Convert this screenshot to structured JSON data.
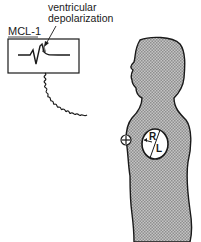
{
  "diagram": {
    "annotation": {
      "line1": "ventricular",
      "line2": "depolarization"
    },
    "monitor": {
      "lead_label": "MCL-1",
      "waveform": "ecg-qrs-complex"
    },
    "electrode": {
      "symbol": "+"
    },
    "heart": {
      "right_label": "R",
      "left_label": "L"
    },
    "colors": {
      "ink": "#1a1a1a",
      "body_fill": "#b5b5b5",
      "background": "#ffffff"
    }
  }
}
